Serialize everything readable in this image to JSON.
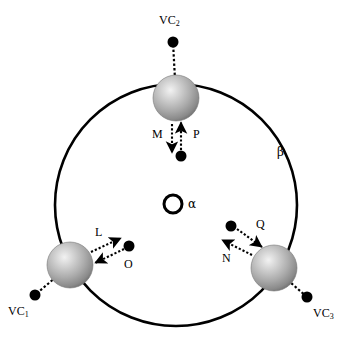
{
  "figure": {
    "title": "",
    "background_color": "#ffffff",
    "width": 353,
    "height": 341
  },
  "colors": {
    "stroke": "#000000",
    "sphere_light": "#e8e8e8",
    "sphere_mid": "#a8a8a8",
    "sphere_dark": "#6e6e6e",
    "dot": "#000000",
    "page": "#ffffff"
  },
  "shapes": {
    "outer_circle": {
      "name": "beta-circle",
      "cx": 176,
      "cy": 205,
      "r": 121,
      "stroke_width": 2.6,
      "fill": "none"
    },
    "center_circle": {
      "name": "alpha-circle",
      "cx": 173,
      "cy": 204,
      "r": 9,
      "stroke_width": 3,
      "fill": "#ffffff"
    }
  },
  "labels": {
    "alpha": "α",
    "beta": "β",
    "vc1_prefix": "VC",
    "vc1_sub": "1",
    "vc2_prefix": "VC",
    "vc2_sub": "2",
    "vc3_prefix": "VC",
    "vc3_sub": "3",
    "force_M": "M",
    "force_P": "P",
    "force_L": "L",
    "force_O": "O",
    "force_N": "N",
    "force_Q": "Q"
  },
  "spheres": [
    {
      "id": "sphere-top",
      "label": "VC2",
      "cx": 176,
      "cy": 98,
      "r": 23
    },
    {
      "id": "sphere-bottom-left",
      "label": "VC1",
      "cx": 70,
      "cy": 265,
      "r": 23
    },
    {
      "id": "sphere-bottom-right",
      "label": "VC3",
      "cx": 274,
      "cy": 268,
      "r": 23
    }
  ],
  "tether_dots": [
    {
      "id": "dot-vc2",
      "cx": 173,
      "cy": 42,
      "r": 5.5
    },
    {
      "id": "dot-vc1",
      "cx": 35,
      "cy": 295,
      "r": 5.5
    },
    {
      "id": "dot-vc3",
      "cx": 307,
      "cy": 297,
      "r": 5.5
    }
  ],
  "arrow_pairs": [
    {
      "group": "top-pair",
      "outward": {
        "label": "M",
        "x1": 176,
        "y1": 124,
        "x2": 172,
        "y2": 155
      },
      "inward": {
        "label": "P",
        "x1": 181,
        "y1": 152,
        "x2": 178,
        "y2": 122
      },
      "source_dot": {
        "cx": 181,
        "cy": 156,
        "r": 5.5
      }
    },
    {
      "group": "bottom-left-pair",
      "outward": {
        "label": "L",
        "x1": 91,
        "y1": 251,
        "x2": 122,
        "y2": 238
      },
      "inward": {
        "label": "O",
        "x1": 124,
        "y1": 249,
        "x2": 94,
        "y2": 262
      },
      "source_dot": {
        "cx": 129,
        "cy": 246,
        "r": 5.5
      }
    },
    {
      "group": "bottom-right-pair",
      "outward": {
        "label": "N",
        "x1": 251,
        "y1": 254,
        "x2": 221,
        "y2": 240
      },
      "inward": {
        "label": "Q",
        "x1": 236,
        "y1": 228,
        "x2": 262,
        "y2": 246
      },
      "source_dot": {
        "cx": 231,
        "cy": 226,
        "r": 5.5
      }
    }
  ],
  "label_positions": {
    "alpha": {
      "x": 188,
      "y": 198
    },
    "beta": {
      "x": 277,
      "y": 146
    },
    "vc2": {
      "x": 159,
      "y": 14
    },
    "vc1": {
      "x": 8,
      "y": 305
    },
    "vc3": {
      "x": 313,
      "y": 307
    },
    "force_M": {
      "x": 152,
      "y": 128
    },
    "force_P": {
      "x": 193,
      "y": 128
    },
    "force_L": {
      "x": 95,
      "y": 226
    },
    "force_O": {
      "x": 124,
      "y": 258
    },
    "force_N": {
      "x": 222,
      "y": 252
    },
    "force_Q": {
      "x": 256,
      "y": 218
    }
  }
}
